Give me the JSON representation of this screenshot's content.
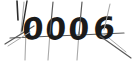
{
  "captcha": {
    "solution_text": "0006",
    "characters": [
      {
        "glyph": "0",
        "x": 22,
        "y": 40,
        "rotate": -4,
        "skew": -6,
        "scale_x": 1.02,
        "scale_y": 1.0
      },
      {
        "glyph": "0",
        "x": 45,
        "y": 40,
        "rotate": -3,
        "skew": -5,
        "scale_x": 1.0,
        "scale_y": 1.0
      },
      {
        "glyph": "0",
        "x": 68,
        "y": 40,
        "rotate": -3,
        "skew": -5,
        "scale_x": 1.0,
        "scale_y": 1.0
      },
      {
        "glyph": "6",
        "x": 93,
        "y": 40,
        "rotate": -6,
        "skew": -7,
        "scale_x": 1.05,
        "scale_y": 1.0
      }
    ],
    "background_color": "#ffffff",
    "text_color": "#1a1a1a",
    "noise_color": "#5a5a5a",
    "noise_color_faint": "#a9a9a9",
    "width": 134,
    "height": 62,
    "noise_lines": [
      {
        "name": "vertical-stroke-1",
        "d": "M 24 2 L 21 33",
        "width": 1.1,
        "tone": "faint"
      },
      {
        "name": "vertical-stroke-2",
        "d": "M 27 1 L 22 31",
        "width": 1.4,
        "tone": "dark"
      },
      {
        "name": "vertical-stroke-3",
        "d": "M 26 30 L 25 60",
        "width": 1.1,
        "tone": "faint"
      },
      {
        "name": "vertical-stroke-4",
        "d": "M 53 2 L 50 34",
        "width": 1.2,
        "tone": "normal"
      },
      {
        "name": "vertical-stroke-5",
        "d": "M 50 32 L 48 60",
        "width": 1.1,
        "tone": "faint"
      },
      {
        "name": "vertical-stroke-6",
        "d": "M 82 2 L 79 34",
        "width": 1.2,
        "tone": "normal"
      },
      {
        "name": "vertical-stroke-7",
        "d": "M 79 32 L 77 60",
        "width": 1.1,
        "tone": "faint"
      },
      {
        "name": "vertical-stroke-8",
        "d": "M 110 4 L 104 30",
        "width": 1.1,
        "tone": "faint"
      },
      {
        "name": "diagonal-stroke-left",
        "d": "M 5 44 L 34 26",
        "width": 1.3,
        "tone": "normal"
      },
      {
        "name": "diagonal-stroke-left-2",
        "d": "M 8 46 L 30 32",
        "width": 1.0,
        "tone": "faint"
      },
      {
        "name": "horizontal-sweep",
        "d": "M 10 38 L 124 33",
        "width": 1.2,
        "tone": "normal"
      },
      {
        "name": "diagonal-stroke-right",
        "d": "M 100 36 L 131 58",
        "width": 1.2,
        "tone": "normal"
      },
      {
        "name": "diagonal-stroke-right-2",
        "d": "M 104 34 L 126 52",
        "width": 1.0,
        "tone": "faint"
      },
      {
        "name": "corner-stroke-top-left",
        "d": "M 17 1 L 18 20",
        "width": 1.6,
        "tone": "dark"
      }
    ]
  }
}
